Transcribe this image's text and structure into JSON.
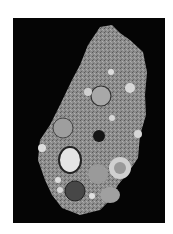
{
  "image": {
    "description": "Grayscale micrograph of a rock/meteorite thin section with round inclusions on a black background",
    "background_color": "#050505",
    "page_color": "#ffffff",
    "matrix_color": "#8a8a8a"
  }
}
